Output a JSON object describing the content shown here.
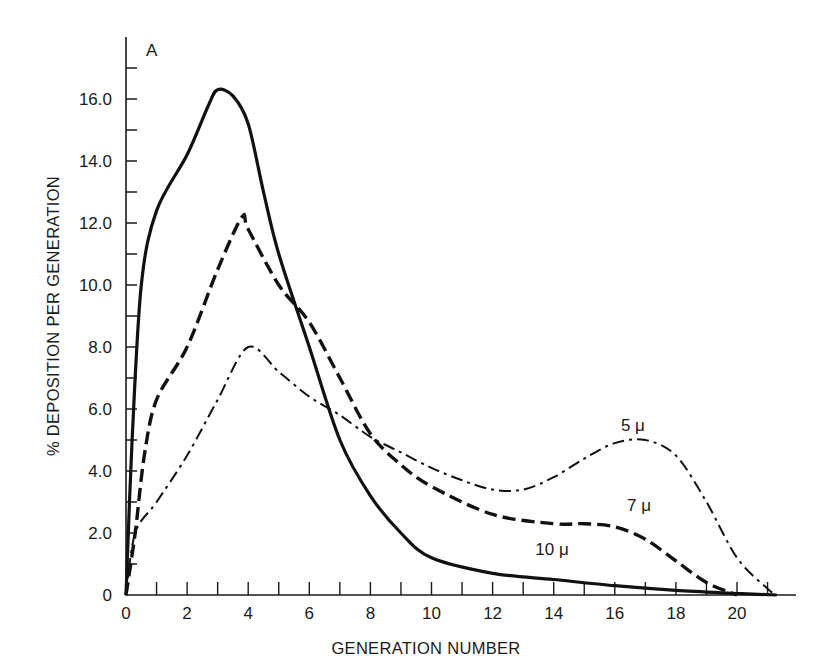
{
  "chart_data": {
    "type": "line",
    "panel_label": "A",
    "title": "",
    "xlabel": "GENERATION NUMBER",
    "ylabel": "% DEPOSITION PER GENERATION",
    "xlim": [
      0,
      22
    ],
    "ylim": [
      0,
      17.5
    ],
    "grid": false,
    "legend_position": "inline labels",
    "x_ticks": [
      0,
      2,
      4,
      6,
      8,
      10,
      12,
      14,
      16,
      18,
      20
    ],
    "x_tick_labels": [
      "0",
      "2",
      "4",
      "6",
      "8",
      "10",
      "12",
      "14",
      "16",
      "18",
      "20"
    ],
    "y_ticks": [
      0,
      2,
      4,
      6,
      8,
      10,
      12,
      14,
      16
    ],
    "y_tick_labels": [
      "0",
      "2.0",
      "4.0",
      "6.0",
      "8.0",
      "10.0",
      "12.0",
      "14.0",
      "16.0"
    ],
    "series": [
      {
        "name": "10 μ",
        "style": "solid",
        "label_pos": [
          13.4,
          1.3
        ],
        "x": [
          0,
          0.2,
          0.5,
          1,
          2,
          2.7,
          3,
          3.5,
          4,
          4.5,
          5,
          6,
          7,
          8,
          9,
          10,
          12,
          14,
          16,
          18,
          20,
          21.3
        ],
        "y": [
          0,
          5,
          10,
          12.4,
          14.2,
          15.8,
          16.3,
          16.1,
          15.2,
          13,
          11,
          8,
          5,
          3.2,
          2,
          1.2,
          0.7,
          0.5,
          0.3,
          0.15,
          0.05,
          0
        ]
      },
      {
        "name": "7 μ",
        "style": "dashed",
        "label_pos": [
          16.4,
          2.7
        ],
        "x": [
          0,
          0.3,
          0.6,
          1,
          2,
          3,
          3.8,
          4,
          5,
          6,
          7,
          8,
          9,
          10,
          12,
          14,
          15,
          16,
          17,
          18,
          19,
          20
        ],
        "y": [
          0,
          2,
          4.5,
          6.3,
          8,
          10.5,
          12.2,
          11.8,
          10,
          8.8,
          7,
          5.2,
          4.2,
          3.5,
          2.6,
          2.3,
          2.3,
          2.2,
          1.8,
          1.1,
          0.4,
          0
        ]
      },
      {
        "name": "5 μ",
        "style": "dash-dot",
        "label_pos": [
          16.2,
          5.3
        ],
        "x": [
          0,
          0.3,
          1,
          2,
          3,
          4,
          5,
          6,
          7,
          8,
          9,
          10,
          11,
          12,
          13,
          14,
          15,
          16,
          17,
          18,
          19,
          20,
          21,
          21.3
        ],
        "y": [
          0,
          2,
          3,
          4.5,
          6.3,
          8,
          7.2,
          6.4,
          5.8,
          5.1,
          4.6,
          4.1,
          3.7,
          3.4,
          3.4,
          3.8,
          4.4,
          4.9,
          5,
          4.5,
          3,
          1.2,
          0.2,
          0
        ]
      }
    ]
  }
}
